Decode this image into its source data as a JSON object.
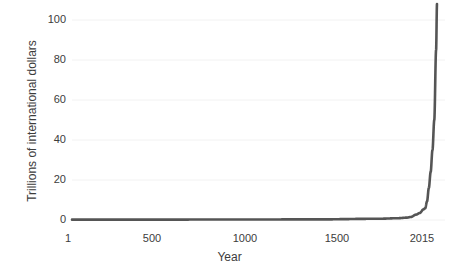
{
  "chart_data": {
    "type": "line",
    "title": "",
    "subtitle": "",
    "xlabel": "Year",
    "ylabel": "Trillions of international dollars",
    "xlim": [
      1,
      2015
    ],
    "ylim": [
      0,
      110
    ],
    "xticks": [
      1,
      500,
      1000,
      1500,
      2015
    ],
    "xtick_labels": [
      "1",
      "500",
      "1000",
      "1500",
      "2015"
    ],
    "yticks": [
      0,
      20,
      40,
      60,
      80,
      100
    ],
    "ytick_labels": [
      "0",
      "20",
      "40",
      "60",
      "80",
      "100"
    ],
    "grid": true,
    "grid_axis": "y",
    "legend": false,
    "legend_position": "none",
    "series": [
      {
        "name": "World GDP",
        "color": "#555555",
        "line_width": 2.6,
        "x": [
          1,
          200,
          400,
          600,
          800,
          1000,
          1100,
          1200,
          1300,
          1400,
          1500,
          1600,
          1700,
          1800,
          1850,
          1870,
          1900,
          1920,
          1940,
          1950,
          1960,
          1970,
          1980,
          1990,
          2000,
          2010,
          2015
        ],
        "y": [
          0.18,
          0.2,
          0.2,
          0.21,
          0.23,
          0.25,
          0.27,
          0.3,
          0.32,
          0.29,
          0.43,
          0.58,
          0.64,
          0.9,
          1.2,
          1.5,
          2.7,
          3.5,
          5.3,
          5.9,
          9.3,
          16.0,
          24.0,
          35.0,
          50.0,
          85.0,
          108.0
        ]
      }
    ],
    "annotations": [],
    "axis_color": "#3c3c3c",
    "grid_color": "#f2f2f2",
    "background": "#ffffff"
  },
  "axes": {
    "x_title": "Year",
    "y_title": "Trillions of international dollars"
  }
}
